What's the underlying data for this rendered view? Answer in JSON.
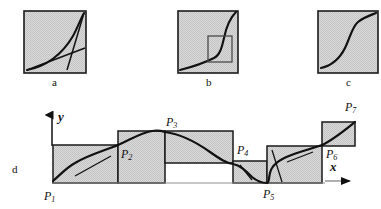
{
  "figure": {
    "width": 381,
    "height": 209,
    "background_color": "#ffffff",
    "panel_fill_color": "#d2d2d2",
    "panel_stroke_color": "#1a1a1a",
    "curve_color": "#111111"
  },
  "top_panels": [
    {
      "id": "panel-a",
      "letter": "a",
      "letter_x": 52,
      "letter_y": 83,
      "box": {
        "x": 24,
        "y": 11,
        "w": 62,
        "h": 62
      },
      "curve": "convex-increasing-with-tangent-and-secant",
      "has_inset_rect": false
    },
    {
      "id": "panel-b",
      "letter": "b",
      "letter_x": 206,
      "letter_y": 83,
      "box": {
        "x": 178,
        "y": 11,
        "w": 60,
        "h": 62
      },
      "curve": "sharp-knee-increasing-with-zoom-box",
      "has_inset_rect": true,
      "inset_rect": {
        "x": 208,
        "y": 36,
        "w": 24,
        "h": 26
      }
    },
    {
      "id": "panel-c",
      "letter": "c",
      "letter_x": 346,
      "letter_y": 83,
      "box": {
        "x": 318,
        "y": 11,
        "w": 60,
        "h": 62
      },
      "curve": "sigmoid-increasing",
      "has_inset_rect": false
    }
  ],
  "bottom_panel": {
    "id": "panel-d",
    "letter": "d",
    "letter_x": 12,
    "letter_y": 166,
    "axes": {
      "y_label": "y",
      "y_label_x": 58,
      "y_label_y": 111,
      "x_label": "x",
      "x_label_x": 348,
      "x_label_y": 160,
      "y_axis": {
        "x": 52,
        "y_top": 112,
        "y_bottom": 146
      },
      "x_axis": {
        "y": 181,
        "x_left": 325,
        "x_right": 357
      }
    },
    "boxes": [
      {
        "name": "segment-box-1",
        "x": 53,
        "y": 145,
        "w": 65,
        "h": 38
      },
      {
        "name": "segment-box-2",
        "x": 118,
        "y": 131,
        "w": 47,
        "h": 52
      },
      {
        "name": "segment-box-3",
        "x": 165,
        "y": 131,
        "w": 68,
        "h": 32
      },
      {
        "name": "segment-box-4",
        "x": 233,
        "y": 161,
        "w": 34,
        "h": 22
      },
      {
        "name": "segment-box-5",
        "x": 267,
        "y": 146,
        "w": 55,
        "h": 37
      },
      {
        "name": "segment-box-6",
        "x": 322,
        "y": 122,
        "w": 33,
        "h": 24
      }
    ],
    "control_points": [
      {
        "label": "P",
        "sub": "1",
        "x": 44,
        "y": 199,
        "node_x": 53,
        "node_y": 183
      },
      {
        "label": "P",
        "sub": "2",
        "x": 122,
        "y": 154,
        "node_x": 118,
        "node_y": 145
      },
      {
        "label": "P",
        "sub": "3",
        "x": 168,
        "y": 125,
        "node_x": 165,
        "node_y": 131
      },
      {
        "label": "P",
        "sub": "4",
        "x": 239,
        "y": 150,
        "node_x": 233,
        "node_y": 163
      },
      {
        "label": "P",
        "sub": "5",
        "x": 266,
        "y": 197,
        "node_x": 267,
        "node_y": 183
      },
      {
        "label": "P",
        "sub": "6",
        "x": 327,
        "y": 155,
        "node_x": 322,
        "node_y": 146
      },
      {
        "label": "P",
        "sub": "7",
        "x": 347,
        "y": 108,
        "node_x": 355,
        "node_y": 122
      }
    ],
    "curve_description": "piecewise-monotone-spline-through-P1-to-P7",
    "tangent_segments": [
      {
        "name": "tangent-at-P1-segment",
        "x1": 75,
        "y1": 176,
        "x2": 111,
        "y2": 156
      },
      {
        "name": "tangent-at-P5-left",
        "x1": 240,
        "y1": 165,
        "x2": 252,
        "y2": 180
      },
      {
        "name": "tangent-at-P5-right",
        "x1": 272,
        "y1": 150,
        "x2": 283,
        "y2": 182
      },
      {
        "name": "tangent-at-P6-segment",
        "x1": 287,
        "y1": 162,
        "x2": 313,
        "y2": 152
      }
    ],
    "baseline": {
      "name": "baseline-rule",
      "y": 183,
      "x_left": 53,
      "x_right": 325
    }
  }
}
